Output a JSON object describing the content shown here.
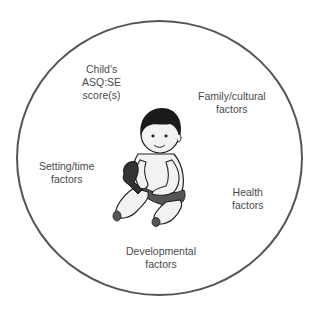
{
  "diagram": {
    "title": "",
    "center": {
      "icon": "seated-baby-illustration",
      "description": "Illustration of a seated infant holding a toy"
    },
    "labels": [
      {
        "id": "asqse-scores",
        "lines": [
          "Child's",
          "ASQ:SE",
          "score(s)"
        ]
      },
      {
        "id": "family-cultural",
        "lines": [
          "Family/cultural",
          "factors"
        ]
      },
      {
        "id": "setting-time",
        "lines": [
          "Setting/time",
          "factors"
        ]
      },
      {
        "id": "health",
        "lines": [
          "Health",
          "factors"
        ]
      },
      {
        "id": "developmental",
        "lines": [
          "Developmental",
          "factors"
        ]
      }
    ],
    "colors": {
      "ring": "#555555",
      "text": "#4a4a4a",
      "hair": "#1a1a1a",
      "skin": "#f2f2f2",
      "diaper": "#555555"
    }
  }
}
